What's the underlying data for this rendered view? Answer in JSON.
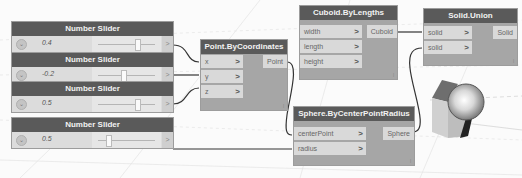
{
  "canvas": {
    "background": "#fbfbfb",
    "node_header_color": "#5a5a5a",
    "node_body_color": "#a6a6a6",
    "wire_color": "#333333"
  },
  "sliders": [
    {
      "title": "Number Slider",
      "value": "0.4",
      "thumb_pct": 0.62,
      "output": ">"
    },
    {
      "title": "Number Slider",
      "value": "-0.2",
      "thumb_pct": 0.42,
      "output": ">"
    },
    {
      "title": "Number Slider",
      "value": "0.5",
      "thumb_pct": 0.62,
      "output": ">"
    },
    {
      "title": "Number Slider",
      "value": "0.5",
      "thumb_pct": 0.2,
      "output": ">"
    }
  ],
  "nodes": {
    "point": {
      "title": "Point.ByCoordinates",
      "inputs": [
        {
          "label": "x",
          "chev": ">"
        },
        {
          "label": "y",
          "chev": ">"
        },
        {
          "label": "z",
          "chev": ">"
        }
      ],
      "output": "Point",
      "footer": "l"
    },
    "cuboid": {
      "title": "Cuboid.ByLengths",
      "inputs": [
        {
          "label": "width",
          "chev": ">"
        },
        {
          "label": "length",
          "chev": ">"
        },
        {
          "label": "height",
          "chev": ">"
        }
      ],
      "output": "Cuboid",
      "footer": "l"
    },
    "sphere": {
      "title": "Sphere.ByCenterPointRadius",
      "inputs": [
        {
          "label": "centerPoint",
          "chev": ">"
        },
        {
          "label": "radius",
          "chev": ">"
        }
      ],
      "output": "Sphere",
      "footer": "l"
    },
    "union": {
      "title": "Solid.Union",
      "inputs": [
        {
          "label": "solid",
          "chev": ">"
        },
        {
          "label": "solid",
          "chev": ">"
        }
      ],
      "output": "Solid",
      "footer": "l"
    }
  },
  "preview": {
    "objects": [
      "cube",
      "sphere"
    ]
  }
}
